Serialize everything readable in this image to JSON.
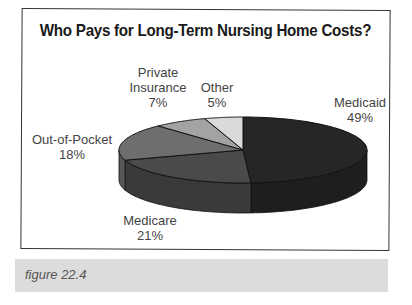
{
  "title": "Who Pays for Long-Term Nursing Home Costs?",
  "caption": "figure 22.4",
  "labels": {
    "medicaid": {
      "name": "Medicaid",
      "pct": "49%"
    },
    "medicare": {
      "name": "Medicare",
      "pct": "21%"
    },
    "out_of_pocket": {
      "name": "Out-of-Pocket",
      "pct": "18%"
    },
    "private": {
      "name1": "Private",
      "name2": "Insurance",
      "pct": "7%"
    },
    "other": {
      "name": "Other",
      "pct": "5%"
    }
  },
  "colors": {
    "medicaid": "#262626",
    "medicare": "#4a4a4a",
    "out_of_pocket": "#6e6e6e",
    "private": "#a3a3a3",
    "other": "#dadada",
    "frame": "#333333",
    "caption_band": "#dcdcdc"
  },
  "chart_data": {
    "type": "pie",
    "style": "3d",
    "title": "Who Pays for Long-Term Nursing Home Costs?",
    "categories": [
      "Medicaid",
      "Medicare",
      "Out-of-Pocket",
      "Private Insurance",
      "Other"
    ],
    "values": [
      49,
      21,
      18,
      7,
      5
    ],
    "unit": "%",
    "start_angle": "12 o'clock",
    "direction": "clockwise",
    "legend": "none (direct labels)",
    "caption": "figure 22.4"
  }
}
